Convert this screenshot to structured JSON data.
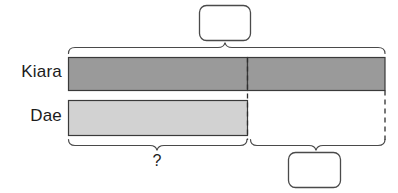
{
  "diagram": {
    "type": "tape-diagram",
    "title": "",
    "background_color": "#ffffff",
    "rows": [
      {
        "name": "kiara",
        "label": "Kiara",
        "bar_color": "#9a9a9a",
        "bar_border_color": "#3a3a3a",
        "segments": [
          {
            "name": "matched-portion",
            "start_x": 68,
            "end_x": 247
          },
          {
            "name": "extra-portion",
            "start_x": 247,
            "end_x": 385
          }
        ]
      },
      {
        "name": "dae",
        "label": "Dae",
        "bar_color": "#d2d2d2",
        "bar_border_color": "#3a3a3a",
        "segments": [
          {
            "name": "full-portion",
            "start_x": 68,
            "end_x": 247
          }
        ]
      }
    ],
    "braces": [
      {
        "name": "total-brace-top",
        "position": "top",
        "from_x": 68,
        "to_x": 385,
        "apex_x": 225,
        "label_box": "box-top"
      },
      {
        "name": "shared-amount-brace-bottom-left",
        "position": "bottom",
        "from_x": 68,
        "to_x": 247,
        "apex_x": 157,
        "label": "?"
      },
      {
        "name": "difference-brace-bottom-right",
        "position": "bottom",
        "from_x": 250,
        "to_x": 385,
        "apex_x": 316,
        "label_box": "box-bottom"
      }
    ],
    "answer_boxes": [
      {
        "name": "box-top",
        "value": "",
        "placeholder": ""
      },
      {
        "name": "box-bottom",
        "value": "",
        "placeholder": ""
      }
    ],
    "unknown_label": "?",
    "line_color": "#4a4a4a",
    "dashed_guides": [
      {
        "name": "divider-dashed-line",
        "x": 247,
        "from_y": 57,
        "to_y": 140
      },
      {
        "name": "right-edge-dashed-line",
        "x": 385,
        "from_y": 90,
        "to_y": 140
      }
    ]
  }
}
